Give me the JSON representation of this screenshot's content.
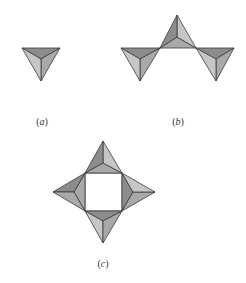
{
  "figure": {
    "colors": {
      "background": "#ffffff",
      "edge": "#3a3a3a",
      "face_dark": "#8c8c8c",
      "face_medium": "#a9a9a9",
      "face_light": "#c6c6c6"
    },
    "panels": [
      {
        "id": "a",
        "label": "(a)",
        "label_pos": [
          42,
          125
        ],
        "tetrahedra": [
          {
            "v": [
              [
                22,
                48
              ],
              [
                60,
                48
              ],
              [
                41,
                81
              ]
            ],
            "c": [
              41,
              59
            ]
          }
        ]
      },
      {
        "id": "b",
        "label": "(b)",
        "label_pos": [
          178,
          125
        ],
        "tetrahedra": [
          {
            "v": [
              [
                121,
                48
              ],
              [
                160,
                48
              ],
              [
                140,
                81
              ]
            ],
            "c": [
              140,
              59
            ]
          },
          {
            "v": [
              [
                160,
                48
              ],
              [
                196,
                48
              ],
              [
                177,
                15
              ]
            ],
            "c": [
              177,
              37
            ]
          },
          {
            "v": [
              [
                196,
                48
              ],
              [
                234,
                48
              ],
              [
                216,
                81
              ]
            ],
            "c": [
              216,
              59
            ]
          }
        ]
      },
      {
        "id": "c",
        "label": "(c)",
        "label_pos": [
          103,
          267
        ],
        "square": [
          [
            85,
            173
          ],
          [
            122,
            173
          ],
          [
            122,
            211
          ],
          [
            85,
            211
          ]
        ],
        "tetrahedra": [
          {
            "v": [
              [
                85,
                173
              ],
              [
                122,
                173
              ],
              [
                103,
                141
              ]
            ],
            "c": [
              103,
              163
            ]
          },
          {
            "v": [
              [
                122,
                173
              ],
              [
                122,
                211
              ],
              [
                155,
                192
              ]
            ],
            "c": [
              133,
              192
            ]
          },
          {
            "v": [
              [
                122,
                211
              ],
              [
                85,
                211
              ],
              [
                103,
                243
              ]
            ],
            "c": [
              103,
              221
            ]
          },
          {
            "v": [
              [
                85,
                211
              ],
              [
                85,
                173
              ],
              [
                53,
                192
              ]
            ],
            "c": [
              74,
              192
            ]
          }
        ]
      }
    ]
  }
}
